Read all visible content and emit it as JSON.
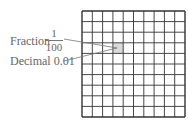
{
  "diagram": {
    "type": "hundred-grid",
    "rows": 10,
    "cols": 10,
    "shaded_cell": {
      "row": 3,
      "col": 3
    },
    "shade_color": "#d9d9d9",
    "labels": {
      "fraction_label": "Fraction",
      "fraction_numerator": "1",
      "fraction_denominator": "100",
      "decimal_label": "Decimal 0.01"
    }
  }
}
